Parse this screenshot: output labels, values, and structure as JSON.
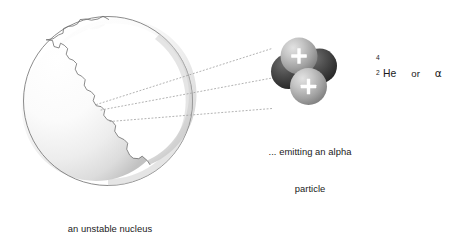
{
  "figure": {
    "title_alt": "alpha decay of an unstable nucleus",
    "background_color": "#ffffff",
    "ink_color": "#1a1a1a"
  },
  "nucleus": {
    "caption_line1": "an unstable nucleus",
    "caption_line2": "splits apart ...",
    "outline_color": "#6b6b6b",
    "fill_light": "#ffffff",
    "fill_shade": "#c9c9c9"
  },
  "alpha_particle": {
    "caption_line1": "... emitting an alpha",
    "caption_line2": "particle",
    "proton_color": "#b0b0b0",
    "neutron_color": "#3d3d3d",
    "charge_symbol": "+",
    "proton_count": 2,
    "neutron_count": 2
  },
  "connector_lines": {
    "style": "dotted",
    "count": 3,
    "color": "#9a9a9a"
  },
  "notation": {
    "mass_number": "4",
    "atomic_number": "2",
    "element_symbol": "He",
    "conjunction": "or",
    "alpha_symbol": "α"
  }
}
